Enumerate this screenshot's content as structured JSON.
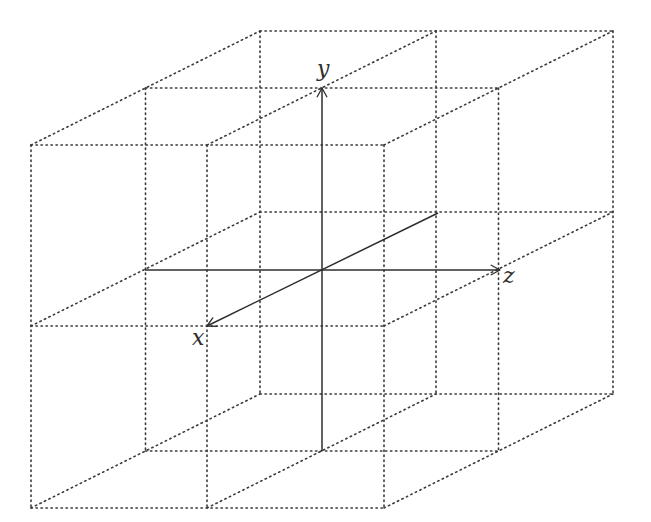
{
  "diagram": {
    "colors": {
      "grid": "#3a3a3a",
      "axis": "#2e2e2e",
      "background": "#ffffff"
    },
    "lattice": {
      "front_plane": {
        "xs": [
          31,
          207,
          384
        ],
        "ys": [
          145,
          326,
          508
        ]
      },
      "depth_offset": {
        "dx": 114.5,
        "dy": -57
      },
      "planes": 3
    },
    "axes": {
      "origin": [
        322,
        270
      ],
      "x": {
        "label": "x",
        "from": [
          438,
          213
        ],
        "to": [
          207,
          326
        ],
        "label_pos": [
          199,
          345
        ]
      },
      "y": {
        "label": "y",
        "from": [
          322,
          451
        ],
        "to": [
          322,
          88
        ],
        "label_pos": [
          324,
          76
        ]
      },
      "z": {
        "label": "z",
        "from": [
          145,
          270
        ],
        "to": [
          500,
          270
        ],
        "label_pos": [
          510,
          283
        ]
      }
    }
  }
}
